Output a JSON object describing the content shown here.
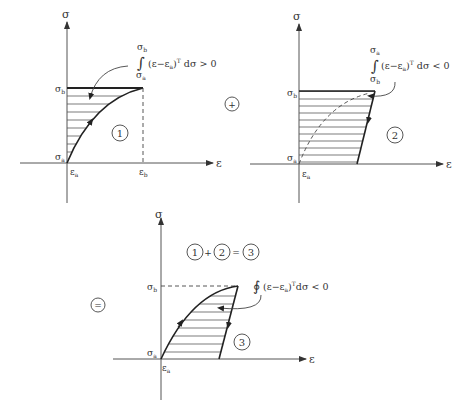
{
  "axis_labels": {
    "y": "σ",
    "x": "ε"
  },
  "panel1": {
    "sigma_b": "σ",
    "sigma_b_sub": "b",
    "sigma_a": "σ",
    "sigma_a_sub": "a",
    "eps_a": "ε",
    "eps_a_sub": "a",
    "eps_b": "ε",
    "eps_b_sub": "b",
    "circle_label": "1",
    "integral_upper": "σ",
    "integral_upper_sub": "b",
    "integral_lower": "σ",
    "integral_lower_sub": "a",
    "integral_sign": "∫",
    "integrand": "(ε−ε",
    "integrand_sub": "a",
    "integrand_rest": ")",
    "integrand_sup": "T",
    "integrand_tail": " dσ > 0"
  },
  "plus_operator": "+",
  "panel2": {
    "sigma_b": "σ",
    "sigma_b_sub": "b",
    "sigma_a": "σ",
    "sigma_a_sub": "a",
    "eps_a": "ε",
    "eps_a_sub": "a",
    "circle_label": "2",
    "integral_upper": "σ",
    "integral_upper_sub": "a",
    "integral_lower": "σ",
    "integral_lower_sub": "b",
    "integral_sign": "∫",
    "integrand": "(ε−ε",
    "integrand_sub": "a",
    "integrand_rest": ")",
    "integrand_sup": "T",
    "integrand_tail": " dσ < 0"
  },
  "equals_operator": "=",
  "panel3": {
    "equation": {
      "a": "1",
      "plus": "+",
      "b": "2",
      "eq": "=",
      "c": "3"
    },
    "sigma_b": "σ",
    "sigma_b_sub": "b",
    "sigma_a": "σ",
    "sigma_a_sub": "a",
    "eps_a": "ε",
    "eps_a_sub": "a",
    "circle_label": "3",
    "integral_sign": "∮",
    "integrand": "(ε−ε",
    "integrand_sub": "a",
    "integrand_rest": ")",
    "integrand_sup": "T",
    "integrand_tail": "dσ < 0"
  }
}
